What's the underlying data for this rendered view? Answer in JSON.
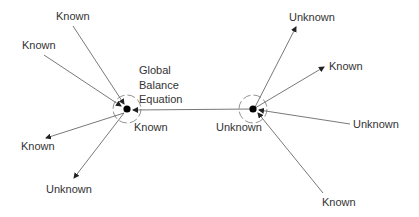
{
  "diagram": {
    "left_node": {
      "title_lines": [
        "Global",
        "Balance",
        "Equation"
      ],
      "below_label": "Known"
    },
    "right_node": {
      "below_label": "Unknown"
    },
    "left_edges": [
      {
        "label": "Known",
        "direction": "in"
      },
      {
        "label": "Known",
        "direction": "in"
      },
      {
        "label": "Known",
        "direction": "out"
      },
      {
        "label": "Unknown",
        "direction": "out"
      }
    ],
    "right_edges": [
      {
        "label": "Unknown",
        "direction": "out"
      },
      {
        "label": "Known",
        "direction": "out"
      },
      {
        "label": "Unknown",
        "direction": "in"
      },
      {
        "label": "Known",
        "direction": "in"
      }
    ],
    "connector": {
      "from": "right_node",
      "to": "left_node"
    }
  }
}
